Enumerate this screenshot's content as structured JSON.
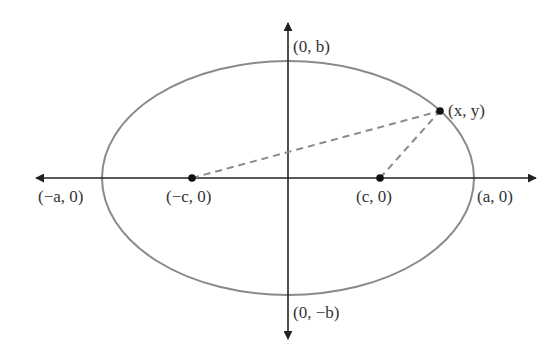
{
  "diagram": {
    "type": "ellipse-foci",
    "center": {
      "x": 288,
      "y": 178
    },
    "rx": 186,
    "ry": 117,
    "colors": {
      "ellipse": "#8a8a8a",
      "axes": "#222222",
      "dashed": "#8a8a8a",
      "points": "#111111",
      "text": "#333333"
    },
    "labels": {
      "top_vertex": "(0, b)",
      "bottom_vertex": "(0, −b)",
      "left_vertex": "(−a, 0)",
      "right_vertex": "(a, 0)",
      "left_focus": "(−c, 0)",
      "right_focus": "(c, 0)",
      "point": "(x, y)"
    },
    "points": {
      "left_focus": {
        "x": 192,
        "y": 178
      },
      "right_focus": {
        "x": 380,
        "y": 178
      },
      "point_on_ellipse": {
        "x": 440,
        "y": 111
      }
    }
  }
}
